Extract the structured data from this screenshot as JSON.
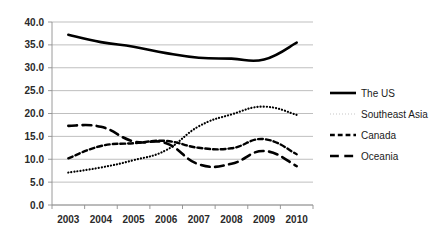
{
  "chart_data": {
    "type": "line",
    "title": "",
    "subtitle": "",
    "xlabel": "",
    "ylabel": "",
    "categories": [
      "2003",
      "2004",
      "2005",
      "2006",
      "2007",
      "2008",
      "2009",
      "2010"
    ],
    "x": [
      2003,
      2004,
      2005,
      2006,
      2007,
      2008,
      2009,
      2010
    ],
    "ylim": [
      0.0,
      40.0
    ],
    "ytick_labels": [
      "0.0",
      "5.0",
      "10.0",
      "15.0",
      "20.0",
      "25.0",
      "30.0",
      "35.0",
      "40.0"
    ],
    "ytick_values": [
      0.0,
      5.0,
      10.0,
      15.0,
      20.0,
      25.0,
      30.0,
      35.0,
      40.0
    ],
    "grid": true,
    "grid_axis": "y",
    "legend_position": "right",
    "series": [
      {
        "name": "The US",
        "style": "solid",
        "color": "#000000",
        "width": 2.6,
        "values": [
          37.2,
          35.6,
          34.6,
          33.2,
          32.2,
          32.0,
          31.8,
          35.5
        ]
      },
      {
        "name": "Southeast Asia",
        "style": "dotted",
        "color": "#000000",
        "width": 2.2,
        "values": [
          7.1,
          8.2,
          9.8,
          12.0,
          17.2,
          19.8,
          21.5,
          19.7
        ]
      },
      {
        "name": "Canada",
        "style": "dashed",
        "color": "#000000",
        "width": 2.4,
        "values": [
          10.2,
          12.9,
          13.5,
          14.0,
          12.5,
          12.4,
          14.4,
          11.1
        ]
      },
      {
        "name": "Oceania",
        "style": "long-dashed",
        "color": "#000000",
        "width": 2.6,
        "values": [
          17.3,
          17.1,
          13.9,
          13.5,
          8.9,
          9.0,
          11.8,
          8.5
        ]
      }
    ]
  },
  "legend": {
    "items": [
      {
        "label": "The US",
        "style": "solid"
      },
      {
        "label": "Southeast Asia",
        "style": "dotted"
      },
      {
        "label": "Canada",
        "style": "dashed"
      },
      {
        "label": "Oceania",
        "style": "long-dashed"
      }
    ]
  },
  "colors": {
    "ink": "#000000",
    "grid": "#aeaeae",
    "axis": "#8e8e8e",
    "background": "#ffffff"
  }
}
